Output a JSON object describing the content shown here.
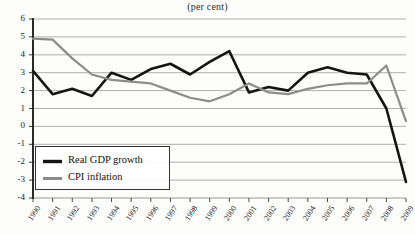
{
  "chart_data": {
    "type": "line",
    "title": "(per cent)",
    "xlabel": "",
    "ylabel": "",
    "ylim": [
      -4,
      6
    ],
    "ytick_labels": [
      "6",
      "5",
      "4",
      "3",
      "2",
      "1",
      "0",
      "-1",
      "-2",
      "-3",
      "-4"
    ],
    "yticks": [
      6,
      5,
      4,
      3,
      2,
      1,
      0,
      -1,
      -2,
      -3,
      -4
    ],
    "grid": true,
    "legend_position": "lower-left",
    "x": [
      1990,
      1991,
      1992,
      1993,
      1994,
      1995,
      1996,
      1997,
      1998,
      1999,
      2000,
      2001,
      2002,
      2003,
      2004,
      2005,
      2006,
      2007,
      2008,
      2009
    ],
    "categories": [
      "1990",
      "1991",
      "1992",
      "1993",
      "1994",
      "1995",
      "1996",
      "1997",
      "1998",
      "1999",
      "2000",
      "2001",
      "2002",
      "2003",
      "2004",
      "2005",
      "2006",
      "2007",
      "2008",
      "2009"
    ],
    "series": [
      {
        "name": "Real GDP growth",
        "color": "#141414",
        "width": 2.6,
        "values": [
          3.1,
          1.8,
          2.1,
          1.7,
          3.0,
          2.6,
          3.2,
          3.5,
          2.9,
          3.6,
          4.2,
          1.9,
          2.2,
          2.0,
          3.0,
          3.3,
          3.0,
          2.9,
          1.0,
          -3.1
        ]
      },
      {
        "name": "CPI inflation",
        "color": "#8c8c8c",
        "width": 2.2,
        "values": [
          4.9,
          4.85,
          3.8,
          2.9,
          2.6,
          2.5,
          2.4,
          2.0,
          1.6,
          1.4,
          1.8,
          2.4,
          1.9,
          1.8,
          2.1,
          2.3,
          2.4,
          2.4,
          3.4,
          0.3
        ]
      }
    ]
  },
  "legend": {
    "items": [
      {
        "label": "Real GDP growth"
      },
      {
        "label": "CPI inflation"
      }
    ]
  }
}
